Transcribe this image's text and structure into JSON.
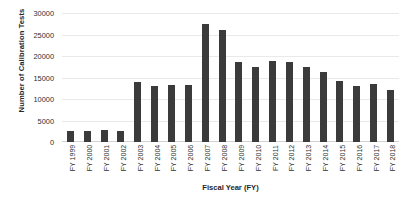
{
  "chart_data": {
    "type": "bar",
    "title": "",
    "xlabel": "Fiscal Year (FY)",
    "ylabel": "Number of Calibration Tests",
    "ylim": [
      0,
      30000
    ],
    "ytick_labels": [
      "30000",
      "25000",
      "20000",
      "15000",
      "10000",
      "5000",
      "0"
    ],
    "ytick_values": [
      30000,
      25000,
      20000,
      15000,
      10000,
      5000,
      0
    ],
    "grid": true,
    "legend": null,
    "bar_color": "#3b3b3b",
    "categories": [
      "FY 1999",
      "FY 2000",
      "FY 2001",
      "FY 2002",
      "FY 2003",
      "FY 2004",
      "FY 2005",
      "FY 2006",
      "FY 2007",
      "FY 2008",
      "FY 2009",
      "FY 2010",
      "FY 2011",
      "FY 2012",
      "FY 2013",
      "FY 2014",
      "FY 2015",
      "FY 2016",
      "FY 2017",
      "FY 2018"
    ],
    "values": [
      2600,
      2600,
      2800,
      2600,
      14000,
      13000,
      13200,
      13200,
      27500,
      26000,
      18700,
      17500,
      18800,
      18600,
      17400,
      16200,
      14200,
      13000,
      13600,
      12000
    ]
  }
}
